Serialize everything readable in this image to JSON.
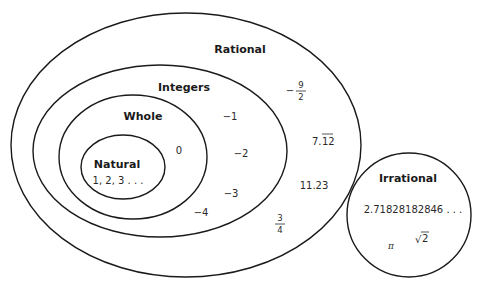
{
  "sets": {
    "rational": {
      "label": "Rational",
      "elements": {
        "neg_nine_halves": {
          "sign": "−",
          "numerator": "9",
          "denominator": "2"
        },
        "repeating": {
          "whole": "7.",
          "repeating": "12"
        },
        "decimal": "11.23",
        "three_quarters": {
          "numerator": "3",
          "denominator": "4"
        }
      }
    },
    "integers": {
      "label": "Integers",
      "elements": [
        "−1",
        "−2",
        "−3",
        "−4"
      ]
    },
    "whole": {
      "label": "Whole",
      "elements": [
        "0"
      ]
    },
    "natural": {
      "label": "Natural",
      "elements_text": "1, 2, 3 . . ."
    },
    "irrational": {
      "label": "Irrational",
      "elements": {
        "e_value": "2.71828182846 . . .",
        "pi": "π",
        "sqrt_symbol": "√",
        "sqrt_radicand": "2"
      }
    }
  },
  "colors": {
    "stroke": "#1a1a1a",
    "text": "#1a1a1a",
    "background": "#ffffff"
  }
}
